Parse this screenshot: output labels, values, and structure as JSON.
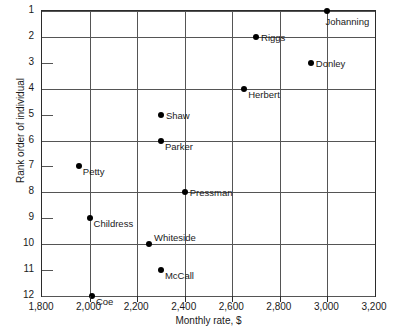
{
  "chart_data": {
    "type": "scatter",
    "title": "",
    "xlabel": "Monthly rate, $",
    "ylabel": "Rank order of individual",
    "xlim": [
      1800,
      3200
    ],
    "ylim": [
      1,
      12
    ],
    "y_inverted": true,
    "grid": true,
    "legend": "none",
    "xticks": [
      1800,
      2000,
      2200,
      2400,
      2600,
      2800,
      3000,
      3200
    ],
    "xtick_labels": [
      "1,800",
      "2,000",
      "2,200",
      "2,400",
      "2,600",
      "2,800",
      "3,000",
      "3,200"
    ],
    "yticks": [
      1,
      2,
      3,
      4,
      5,
      6,
      7,
      8,
      9,
      10,
      11,
      12
    ],
    "ytick_labels": [
      "1",
      "2",
      "3",
      "4",
      "5",
      "6",
      "7",
      "8",
      "9",
      "10",
      "11",
      "12"
    ],
    "gridlines_x": [
      2000,
      2200,
      2400,
      2600,
      2800,
      3000
    ],
    "gridlines_y": [
      1,
      2,
      4,
      6,
      8,
      10,
      12
    ],
    "stub_ticks_y": [
      3,
      5,
      7,
      9,
      11
    ],
    "points": [
      {
        "label": "Johanning",
        "x": 3000,
        "y": 1,
        "label_pos": "below"
      },
      {
        "label": "Riggs",
        "x": 2700,
        "y": 2,
        "label_pos": "right"
      },
      {
        "label": "Donley",
        "x": 2930,
        "y": 3,
        "label_pos": "right"
      },
      {
        "label": "Herbert",
        "x": 2650,
        "y": 4,
        "label_pos": "below-right"
      },
      {
        "label": "Shaw",
        "x": 2300,
        "y": 5,
        "label_pos": "right"
      },
      {
        "label": "Parker",
        "x": 2300,
        "y": 6,
        "label_pos": "below-right"
      },
      {
        "label": "Petty",
        "x": 1955,
        "y": 7,
        "label_pos": "below-right"
      },
      {
        "label": "Pressman",
        "x": 2400,
        "y": 8,
        "label_pos": "right"
      },
      {
        "label": "Childress",
        "x": 2000,
        "y": 9,
        "label_pos": "below-right"
      },
      {
        "label": "Whiteside",
        "x": 2250,
        "y": 10,
        "label_pos": "above-right"
      },
      {
        "label": "McCall",
        "x": 2300,
        "y": 11,
        "label_pos": "below-right"
      },
      {
        "label": "Coe",
        "x": 2010,
        "y": 12,
        "label_pos": "below-right"
      }
    ]
  }
}
